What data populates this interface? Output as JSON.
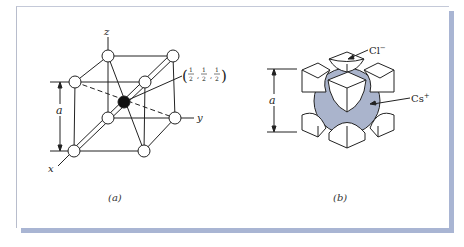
{
  "figure": {
    "panel_a": {
      "caption": "(a)",
      "axes": {
        "z": "z",
        "y": "y",
        "x": "x"
      },
      "dimension_label": "a",
      "center_coordinate": {
        "open": "(",
        "num": "1",
        "den": "2",
        "sep": ",",
        "close": ")"
      }
    },
    "panel_b": {
      "caption": "(b)",
      "dimension_label": "a",
      "anion_label": "Cl",
      "anion_charge": "−",
      "cation_label": "Cs",
      "cation_charge": "+"
    },
    "colors": {
      "border_shadow": "#a9b5d3",
      "cation_sphere": "#aab4cc",
      "line": "#222222"
    }
  }
}
